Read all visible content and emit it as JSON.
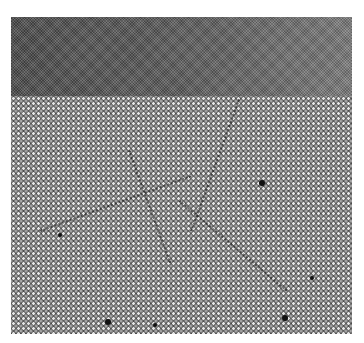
{
  "image": {
    "description": "Grayscale electron micrograph: smooth amorphous/uniform upper layer above a crystalline atomic lattice with grain boundaries and dark defect spots",
    "colors": {
      "background": "#ffffff",
      "top_layer": "#5a5a5a",
      "lattice": "#5c5c5c",
      "defects": "#111111"
    }
  },
  "boundaries": [
    {
      "x": 130,
      "y": 150,
      "len": 120,
      "angle": 70
    },
    {
      "x": 240,
      "y": 100,
      "len": 140,
      "angle": 110
    },
    {
      "x": 40,
      "y": 230,
      "len": 160,
      "angle": -20
    },
    {
      "x": 180,
      "y": 200,
      "len": 140,
      "angle": 40
    }
  ],
  "defects": [
    {
      "x": 262,
      "y": 183,
      "r": 3
    },
    {
      "x": 285,
      "y": 318,
      "r": 3
    },
    {
      "x": 312,
      "y": 278,
      "r": 2
    },
    {
      "x": 108,
      "y": 322,
      "r": 3
    },
    {
      "x": 60,
      "y": 235,
      "r": 2
    },
    {
      "x": 155,
      "y": 325,
      "r": 2
    }
  ],
  "caption": ""
}
